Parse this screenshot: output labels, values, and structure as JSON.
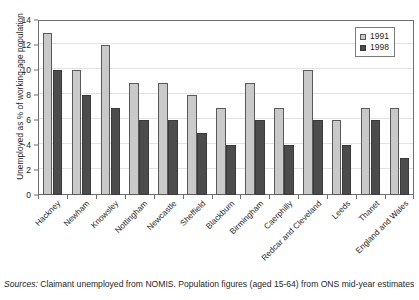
{
  "chart_data": {
    "type": "bar",
    "title": "",
    "xlabel": "",
    "ylabel": "Unemployed as % of working-age population",
    "ylim": [
      0,
      14
    ],
    "ytick_values": [
      0,
      2,
      4,
      6,
      8,
      10,
      12,
      14
    ],
    "ytick_labels": [
      "0",
      "2",
      "4",
      "6",
      "8",
      "10",
      "12",
      "14"
    ],
    "grid": true,
    "legend_position": "top-right",
    "categories": [
      "Hackney",
      "Newham",
      "Knowsley",
      "Nottingham",
      "Newcastle",
      "Sheffield",
      "Blackburn",
      "Birmingham",
      "Caerphilly",
      "Redcar and Cleveland",
      "Leeds",
      "Thanet",
      "England and Wales"
    ],
    "series": [
      {
        "name": "1991",
        "color": "#c9c9c9",
        "values": [
          13,
          10,
          12,
          9,
          9,
          8,
          7,
          9,
          7,
          10,
          6,
          7,
          7
        ]
      },
      {
        "name": "1998",
        "color": "#4c4c4c",
        "values": [
          10,
          8,
          7,
          6,
          6,
          5,
          4,
          6,
          4,
          6,
          4,
          6,
          3
        ]
      }
    ]
  },
  "legend": {
    "entries": [
      {
        "label": "1991"
      },
      {
        "label": "1998"
      }
    ]
  },
  "source": {
    "prefix": "Sources:",
    "text": " Claimant unemployed from NOMIS.  Population figures (aged 15-64) from ONS mid-year estimates"
  }
}
